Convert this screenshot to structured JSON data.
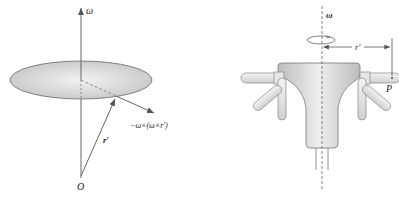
{
  "left_figure": {
    "axis_label": "ω",
    "origin_label": "O",
    "position_vector_label": "r′",
    "centripetal_label": "−ω×(ω×r′)"
  },
  "right_figure": {
    "axis_label": "ω",
    "radius_label": "r′",
    "point_label": "P"
  },
  "colors": {
    "line": "#555555",
    "disk_fill": "#cfcfcf",
    "body_fill": "#d8d8d8"
  }
}
